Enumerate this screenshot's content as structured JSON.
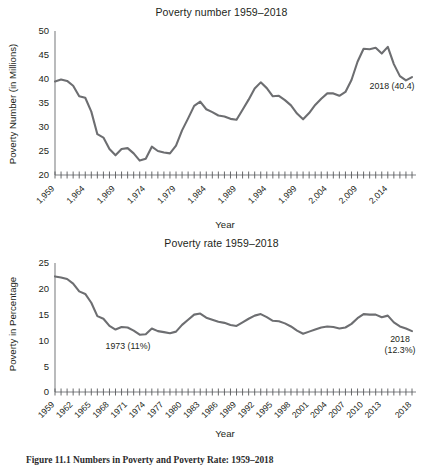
{
  "figure": {
    "caption": "Figure 11.1   Numbers in Poverty and Poverty Rate: 1959–2018"
  },
  "charts": [
    {
      "id": "poverty-number",
      "title": "Poverty number 1959–2018",
      "xlabel": "Year",
      "ylabel": "Poverty Number (in Millions)",
      "ytick_labels": [
        "20",
        "25",
        "30",
        "35",
        "40",
        "45",
        "50"
      ],
      "xtick_labels": [
        "1,959",
        "1,964",
        "1,969",
        "1,974",
        "1,979",
        "1,984",
        "1,989",
        "1,994",
        "1,999",
        "2,004",
        "2,009",
        "2,014"
      ],
      "annotations": [
        {
          "name": "annotation-2018-number",
          "lines": [
            "2018 (40.4)"
          ]
        }
      ]
    },
    {
      "id": "poverty-rate",
      "title": "Poverty rate 1959–2018",
      "xlabel": "Year",
      "ylabel": "Poverty in Percentage",
      "ytick_labels": [
        "0",
        "5",
        "10",
        "15",
        "20",
        "25"
      ],
      "xtick_labels": [
        "1959",
        "1962",
        "1965",
        "1968",
        "1971",
        "1974",
        "1977",
        "1980",
        "1983",
        "1986",
        "1989",
        "1992",
        "1995",
        "1998",
        "2001",
        "2004",
        "2007",
        "2010",
        "2013",
        "2018"
      ],
      "annotations": [
        {
          "name": "annotation-1973-rate",
          "lines": [
            "1973 (11%)"
          ]
        },
        {
          "name": "annotation-2018-rate",
          "lines": [
            "2018",
            "(12.3%)"
          ]
        }
      ]
    }
  ],
  "chart_data": [
    {
      "type": "line",
      "title": "Poverty number 1959–2018",
      "xlabel": "Year",
      "ylabel": "Poverty Number (in Millions)",
      "ylim": [
        20,
        50
      ],
      "ytick_values": [
        20,
        25,
        30,
        35,
        40,
        45,
        50
      ],
      "xlim": [
        1959,
        2018
      ],
      "xtick_values": [
        1959,
        1964,
        1969,
        1974,
        1979,
        1984,
        1989,
        1994,
        1999,
        2004,
        2009,
        2014
      ],
      "grid": false,
      "legend": "none",
      "line_color": "#6d6e71",
      "x": [
        1959,
        1960,
        1961,
        1962,
        1963,
        1964,
        1965,
        1966,
        1967,
        1968,
        1969,
        1970,
        1971,
        1972,
        1973,
        1974,
        1975,
        1976,
        1977,
        1978,
        1979,
        1980,
        1981,
        1982,
        1983,
        1984,
        1985,
        1986,
        1987,
        1988,
        1989,
        1990,
        1991,
        1992,
        1993,
        1994,
        1995,
        1996,
        1997,
        1998,
        1999,
        2000,
        2001,
        2002,
        2003,
        2004,
        2005,
        2006,
        2007,
        2008,
        2009,
        2010,
        2011,
        2012,
        2013,
        2014,
        2015,
        2016,
        2017,
        2018
      ],
      "values": [
        39.5,
        39.9,
        39.6,
        38.6,
        36.4,
        36.1,
        33.2,
        28.5,
        27.8,
        25.4,
        24.1,
        25.4,
        25.6,
        24.5,
        23.0,
        23.4,
        25.9,
        25.0,
        24.7,
        24.5,
        26.1,
        29.3,
        31.8,
        34.4,
        35.3,
        33.7,
        33.1,
        32.4,
        32.2,
        31.7,
        31.5,
        33.6,
        35.7,
        38.0,
        39.3,
        38.1,
        36.4,
        36.5,
        35.6,
        34.5,
        32.8,
        31.6,
        32.9,
        34.6,
        35.9,
        37.0,
        37.0,
        36.5,
        37.3,
        39.8,
        43.6,
        46.3,
        46.2,
        46.5,
        45.3,
        46.7,
        43.1,
        40.6,
        39.7,
        40.4
      ],
      "annotations": [
        {
          "text": "2018 (40.4)",
          "x": 2018,
          "y": 40.4
        }
      ]
    },
    {
      "type": "line",
      "title": "Poverty rate 1959–2018",
      "xlabel": "Year",
      "ylabel": "Poverty in Percentage",
      "ylim": [
        0,
        25
      ],
      "ytick_values": [
        0,
        5,
        10,
        15,
        20,
        25
      ],
      "xlim": [
        1959,
        2018
      ],
      "xtick_values": [
        1959,
        1962,
        1965,
        1968,
        1971,
        1974,
        1977,
        1980,
        1983,
        1986,
        1989,
        1992,
        1995,
        1998,
        2001,
        2004,
        2007,
        2010,
        2013,
        2018
      ],
      "grid": false,
      "legend": "none",
      "line_color": "#6d6e71",
      "x": [
        1959,
        1960,
        1961,
        1962,
        1963,
        1964,
        1965,
        1966,
        1967,
        1968,
        1969,
        1970,
        1971,
        1972,
        1973,
        1974,
        1975,
        1976,
        1977,
        1978,
        1979,
        1980,
        1981,
        1982,
        1983,
        1984,
        1985,
        1986,
        1987,
        1988,
        1989,
        1990,
        1991,
        1992,
        1993,
        1994,
        1995,
        1996,
        1997,
        1998,
        1999,
        2000,
        2001,
        2002,
        2003,
        2004,
        2005,
        2006,
        2007,
        2008,
        2009,
        2010,
        2011,
        2012,
        2013,
        2014,
        2015,
        2016,
        2017,
        2018
      ],
      "values": [
        22.4,
        22.2,
        21.9,
        21.0,
        19.5,
        19.0,
        17.3,
        14.7,
        14.2,
        12.8,
        12.1,
        12.6,
        12.5,
        11.9,
        11.1,
        11.2,
        12.3,
        11.8,
        11.6,
        11.4,
        11.7,
        13.0,
        14.0,
        15.0,
        15.2,
        14.4,
        14.0,
        13.6,
        13.4,
        13.0,
        12.8,
        13.5,
        14.2,
        14.8,
        15.1,
        14.5,
        13.8,
        13.7,
        13.3,
        12.7,
        11.9,
        11.3,
        11.7,
        12.1,
        12.5,
        12.7,
        12.6,
        12.3,
        12.5,
        13.2,
        14.3,
        15.1,
        15.0,
        15.0,
        14.5,
        14.8,
        13.5,
        12.7,
        12.3,
        11.8
      ],
      "annotations": [
        {
          "text": "1973 (11%)",
          "x": 1973,
          "y": 11.1
        },
        {
          "text": "2018 (12.3%)",
          "x": 2018,
          "y": 12.3
        }
      ]
    }
  ]
}
